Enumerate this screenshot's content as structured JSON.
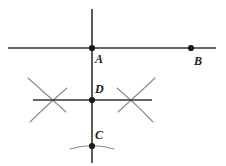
{
  "figure": {
    "name": "perpendicular-bisector-construction",
    "width": 226,
    "height": 166,
    "background_color": "#ffffff",
    "line_color": "#333333",
    "arc_color": "#8a8a8a",
    "point_color": "#1a1a1a",
    "label_color": "#1a1a1a"
  },
  "labels": {
    "a": "A",
    "b": "B",
    "c": "C",
    "d": "D"
  },
  "points": [
    {
      "id": "A",
      "label": "A",
      "x": 92,
      "y": 48,
      "label_x": 95,
      "label_y": 53
    },
    {
      "id": "B",
      "label": "B",
      "x": 191,
      "y": 48,
      "label_x": 194,
      "label_y": 55
    },
    {
      "id": "D",
      "label": "D",
      "x": 92,
      "y": 100,
      "label_x": 95,
      "label_y": 83
    },
    {
      "id": "C",
      "label": "C",
      "x": 92,
      "y": 146,
      "label_x": 95,
      "label_y": 129
    }
  ],
  "lines": [
    {
      "id": "line-AB-horizontal",
      "x1": 8,
      "y1": 48,
      "x2": 216,
      "y2": 48
    },
    {
      "id": "line-vertical-AC",
      "x1": 92,
      "y1": 9,
      "x2": 92,
      "y2": 163
    },
    {
      "id": "line-through-D-horizontal",
      "x1": 33,
      "y1": 100,
      "x2": 152,
      "y2": 100
    },
    {
      "id": "line-arc-through-C",
      "x1": 70,
      "y1": 147,
      "x2": 115,
      "y2": 146
    }
  ],
  "arcs": [
    {
      "id": "left-arc-upper",
      "d": "M 28 78 Q 46 94 66 112"
    },
    {
      "id": "left-arc-lower",
      "d": "M 30 122 Q 46 106 67 88"
    },
    {
      "id": "right-arc-upper",
      "d": "M 155 78 Q 138 94 118 112"
    },
    {
      "id": "right-arc-lower",
      "d": "M 153 122 Q 138 106 117 88"
    },
    {
      "id": "bottom-arc-at-C",
      "d": "M 70 149 Q 92 142 114 149"
    }
  ]
}
